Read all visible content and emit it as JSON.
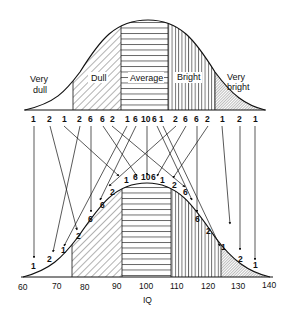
{
  "figure": {
    "top_curve": {
      "regions": [
        {
          "label_line1": "Very",
          "label_line2": "dull",
          "pattern": "none"
        },
        {
          "label_line1": "Dull",
          "label_line2": "",
          "pattern": "diagonal"
        },
        {
          "label_line1": "Average",
          "label_line2": "",
          "pattern": "horizontal"
        },
        {
          "label_line1": "Bright",
          "label_line2": "",
          "pattern": "vertical"
        },
        {
          "label_line1": "Very",
          "label_line2": "bright",
          "pattern": "crosshatch"
        }
      ],
      "counts": [
        "1",
        "2",
        "1",
        "2",
        "6",
        "6",
        "2",
        "1",
        "6",
        "10",
        "6",
        "1",
        "2",
        "6",
        "6",
        "2",
        "1",
        "2",
        "1"
      ]
    },
    "bottom_curve": {
      "counts": [
        "1",
        "2",
        "1",
        "2",
        "6",
        "6",
        "2",
        "1",
        "6",
        "10",
        "6",
        "1",
        "2",
        "6",
        "6",
        "2",
        "1",
        "2",
        "1"
      ],
      "boundaries_iq": [
        76,
        92,
        108,
        124
      ]
    },
    "x_axis": {
      "label": "IQ",
      "ticks": [
        "60",
        "70",
        "80",
        "90",
        "100",
        "110",
        "120",
        "130",
        "140"
      ]
    }
  }
}
